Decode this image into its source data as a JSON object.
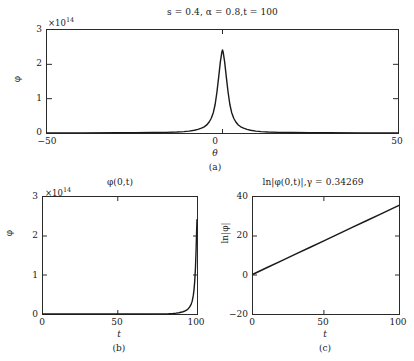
{
  "figure": {
    "width": 414,
    "height": 361,
    "background": "#ffffff",
    "curve_color": "#1a1a1a",
    "axis_color": "#2a2a2a"
  },
  "panel_a": {
    "title": "s = 0.4, α = 0.8,t = 100",
    "sublabel": "(a)",
    "xlabel": "θ",
    "ylabel": "φ",
    "y_multiplier": "×10",
    "y_exponent": "14",
    "xticks": [
      "−50",
      "0",
      "50"
    ],
    "yticks": [
      "0",
      "1",
      "2",
      "3"
    ]
  },
  "panel_b": {
    "title": "φ(0,t)",
    "sublabel": "(b)",
    "xlabel": "t",
    "ylabel": "φ",
    "y_multiplier": "×10",
    "y_exponent": "14",
    "xticks": [
      "0",
      "50",
      "100"
    ],
    "yticks": [
      "0",
      "1",
      "2",
      "3"
    ]
  },
  "panel_c": {
    "title": "ln|φ(0,t)|,γ = 0.34269",
    "sublabel": "(c)",
    "xlabel": "t",
    "ylabel": "ln|φ|",
    "xticks": [
      "0",
      "50",
      "100"
    ],
    "yticks": [
      "−20",
      "0",
      "20",
      "40"
    ]
  },
  "chart_data": [
    {
      "type": "line",
      "panel": "a",
      "title": "s = 0.4, α = 0.8,t = 100",
      "xlabel": "θ",
      "ylabel": "φ",
      "y_scale_exponent": 14,
      "xlim": [
        -50,
        50
      ],
      "ylim": [
        0,
        3
      ],
      "xticks": [
        -50,
        0,
        50
      ],
      "yticks": [
        0,
        1,
        2,
        3
      ],
      "grid": false,
      "legend": null,
      "peak_x": 0,
      "peak_y": 2.42,
      "x": [
        -50,
        -40,
        -30,
        -25,
        -20,
        -16,
        -13,
        -11,
        -9.5,
        -8,
        -7,
        -6,
        -5.2,
        -4.5,
        -3.8,
        -3.2,
        -2.6,
        -2.1,
        -1.6,
        -1.1,
        -0.6,
        -0.2,
        0,
        0.2,
        0.6,
        1.1,
        1.6,
        2.1,
        2.6,
        3.2,
        3.8,
        4.5,
        5.2,
        6,
        7,
        8,
        9.5,
        11,
        13,
        16,
        20,
        25,
        30,
        40,
        50
      ],
      "y": [
        0.004,
        0.005,
        0.007,
        0.009,
        0.013,
        0.019,
        0.028,
        0.04,
        0.055,
        0.08,
        0.105,
        0.14,
        0.18,
        0.235,
        0.32,
        0.43,
        0.6,
        0.83,
        1.18,
        1.62,
        2.08,
        2.35,
        2.42,
        2.35,
        2.08,
        1.62,
        1.18,
        0.83,
        0.6,
        0.43,
        0.32,
        0.235,
        0.18,
        0.14,
        0.105,
        0.08,
        0.055,
        0.04,
        0.028,
        0.019,
        0.013,
        0.009,
        0.007,
        0.005,
        0.004
      ]
    },
    {
      "type": "line",
      "panel": "b",
      "title": "φ(0,t)",
      "xlabel": "t",
      "ylabel": "φ",
      "y_scale_exponent": 14,
      "xlim": [
        0,
        103
      ],
      "ylim": [
        0,
        3
      ],
      "xticks": [
        0,
        50,
        100
      ],
      "yticks": [
        0,
        1,
        2,
        3
      ],
      "grid": false,
      "legend": null,
      "x": [
        0,
        10,
        20,
        30,
        40,
        50,
        60,
        70,
        75,
        80,
        84,
        87,
        89,
        91,
        93,
        94.5,
        96,
        97,
        98,
        99,
        99.8,
        100.5,
        101,
        101.5,
        102,
        102.4,
        102.7,
        103
      ],
      "y": [
        0.0,
        0.0,
        0.0,
        0.0,
        0.0,
        0.0,
        0.0,
        0.001,
        0.002,
        0.004,
        0.008,
        0.014,
        0.021,
        0.032,
        0.05,
        0.07,
        0.1,
        0.13,
        0.175,
        0.24,
        0.33,
        0.47,
        0.62,
        0.85,
        1.2,
        1.65,
        2.05,
        2.42
      ]
    },
    {
      "type": "line",
      "panel": "c",
      "title": "ln|φ(0,t)|,γ = 0.34269",
      "xlabel": "t",
      "ylabel": "ln|φ|",
      "gamma": 0.34269,
      "xlim": [
        0,
        103
      ],
      "ylim": [
        -20,
        40
      ],
      "xticks": [
        0,
        50,
        100
      ],
      "yticks": [
        -20,
        0,
        20,
        40
      ],
      "grid": false,
      "legend": null,
      "x": [
        0,
        10,
        20,
        30,
        40,
        50,
        60,
        70,
        80,
        90,
        100,
        103
      ],
      "y": [
        0.4,
        3.83,
        7.25,
        10.68,
        14.11,
        17.53,
        20.96,
        24.39,
        27.82,
        31.24,
        34.67,
        35.7
      ]
    }
  ]
}
